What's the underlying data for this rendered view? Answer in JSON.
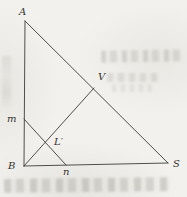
{
  "figure": {
    "kind": "geometry-triangle-diagram",
    "background_color": "#f2f1ed",
    "line_color": "#3d3c3a",
    "label_color": "#34332f",
    "points": {
      "A": {
        "x": 25,
        "y": 21,
        "label": "A",
        "label_x": 19,
        "label_y": 15
      },
      "B": {
        "x": 24,
        "y": 166,
        "label": "B",
        "label_x": 8,
        "label_y": 169
      },
      "S": {
        "x": 168,
        "y": 163,
        "label": "S",
        "label_x": 173,
        "label_y": 167
      },
      "V": {
        "x": 94,
        "y": 88,
        "label": "V",
        "label_x": 98,
        "label_y": 80
      },
      "m": {
        "x": 24,
        "y": 119,
        "label": "m",
        "label_x": 7,
        "label_y": 122
      },
      "n": {
        "x": 66,
        "y": 165,
        "label": "n",
        "label_x": 63,
        "label_y": 175
      },
      "Lprime": {
        "x": 46,
        "y": 143,
        "label": "L′",
        "label_x": 54,
        "label_y": 145
      }
    },
    "segments": [
      {
        "from": "A",
        "to": "B"
      },
      {
        "from": "A",
        "to": "S"
      },
      {
        "from": "B",
        "to": "S"
      },
      {
        "from": "B",
        "to": "V"
      },
      {
        "from": "m",
        "to": "n"
      }
    ]
  }
}
